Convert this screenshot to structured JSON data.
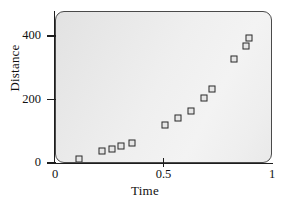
{
  "chart_data": {
    "type": "scatter",
    "title": "",
    "xlabel": "Time",
    "ylabel": "Distance",
    "xlim": [
      0,
      1
    ],
    "ylim": [
      0,
      480
    ],
    "grid": false,
    "legend": null,
    "xticks": [
      0,
      0.5,
      1
    ],
    "xticklabels": [
      "0",
      "0.5",
      "1"
    ],
    "yticks": [
      0,
      200,
      400
    ],
    "yticklabels": [
      "0",
      "200",
      "400"
    ],
    "marker": "open-square",
    "marker_color": "#2b2b2b",
    "plot_background": "#ececec",
    "series": [
      {
        "name": "observations",
        "x": [
          0.106,
          0.21,
          0.26,
          0.3,
          0.35,
          0.5,
          0.56,
          0.62,
          0.68,
          0.72,
          0.82,
          0.876,
          0.89
        ],
        "y": [
          16,
          41,
          47,
          57,
          66,
          123,
          145,
          167,
          208,
          236,
          331,
          372,
          397
        ]
      }
    ]
  }
}
